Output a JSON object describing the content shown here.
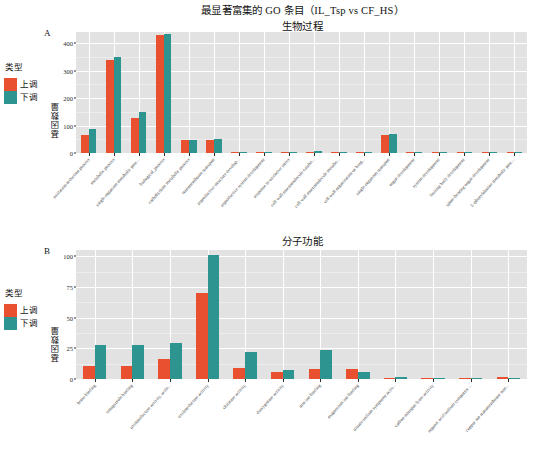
{
  "figure": {
    "main_title": "最显著富集的 GO 条目（IL_Tsp vs CF_HS）",
    "subtitle_a": "生物过程",
    "subtitle_b": "分子功能"
  },
  "legend": {
    "title": "类型",
    "up_label": "上调",
    "down_label": "下调",
    "up_color": "#e8502f",
    "down_color": "#2e9490"
  },
  "axis": {
    "ylabel": "基因数量"
  },
  "panel_a": {
    "letter": "A"
  },
  "panel_b": {
    "letter": "B"
  },
  "chart_data": [
    {
      "type": "bar",
      "panel": "A",
      "title": "最显著富集的 GO 条目（IL_Tsp vs CF_HS）",
      "subtitle": "生物过程",
      "xlabel": "",
      "ylabel": "基因数量",
      "ylim": [
        0,
        440
      ],
      "yticks": [
        0,
        100,
        200,
        300,
        400
      ],
      "grid": true,
      "legend_position": "left",
      "categories": [
        "oxidation-reduction process",
        "metabolic process",
        "single-organism metabolic proc...",
        "biological_process",
        "carbohydrate metabolic process",
        "transmembrane transport",
        "reproductive structure develop...",
        "reproductive system development",
        "response to oxidative stress",
        "cell wall macromolecule catabo...",
        "cell wall macromolecule metabo...",
        "cell wall organization or biog...",
        "single-organism transport",
        "organ development",
        "system development",
        "fruiting body development",
        "spore-bearing organ development",
        "L-phenylalanine metabolic proc..."
      ],
      "series": [
        {
          "name": "上调",
          "color": "#e8502f",
          "values": [
            66,
            337,
            128,
            430,
            47,
            47,
            3,
            2,
            2,
            3,
            4,
            4,
            67,
            2,
            2,
            2,
            2,
            2
          ]
        },
        {
          "name": "下调",
          "color": "#2e9490",
          "values": [
            88,
            349,
            149,
            434,
            46,
            52,
            1,
            1,
            1,
            8,
            1,
            1,
            70,
            1,
            1,
            1,
            1,
            1
          ]
        }
      ]
    },
    {
      "type": "bar",
      "panel": "B",
      "title": "",
      "subtitle": "分子功能",
      "xlabel": "",
      "ylabel": "基因数量",
      "ylim": [
        0,
        105
      ],
      "yticks": [
        0,
        25,
        50,
        75,
        100
      ],
      "grid": true,
      "legend_position": "left",
      "categories": [
        "heme binding",
        "tetrapyrrole binding",
        "oxidoreductase activity, actin...",
        "oxidoreductase activity",
        "chitinase activity",
        "dioxygenase activity",
        "iron ion binding",
        "magnesium ion binding",
        "nitrate:sodium symporter activ...",
        "carbon-nitrogen lyase activity",
        "organic acid:sodium symporter ...",
        "copper ion transmembrane tran..."
      ],
      "series": [
        {
          "name": "上调",
          "color": "#e8502f",
          "values": [
            11,
            11,
            16,
            70,
            9,
            6,
            8,
            8,
            1,
            1,
            1,
            2
          ]
        },
        {
          "name": "下调",
          "color": "#2e9490",
          "values": [
            28,
            28,
            29,
            101,
            22,
            7,
            24,
            6,
            2,
            1,
            1,
            0
          ]
        }
      ]
    }
  ]
}
